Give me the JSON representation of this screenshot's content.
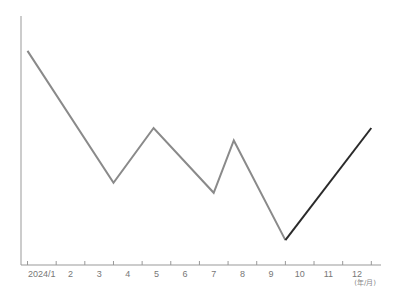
{
  "chart_data": {
    "type": "line",
    "title": "",
    "xlabel": "(年/月)",
    "ylabel": "",
    "grid": false,
    "legend": "none",
    "categories": [
      "2024/1",
      "2",
      "3",
      "4",
      "5",
      "6",
      "7",
      "8",
      "9",
      "10",
      "11",
      "12"
    ],
    "x_unit_label": "(年/月)",
    "ylim": [
      0,
      100
    ],
    "y_ticks_shown": false,
    "series": [
      {
        "name": "trend",
        "color": "#8a8a8a",
        "points": [
          {
            "x": 0.5,
            "y": 86
          },
          {
            "x": 3.5,
            "y": 33
          },
          {
            "x": 4.9,
            "y": 55
          },
          {
            "x": 7.0,
            "y": 29
          },
          {
            "x": 7.7,
            "y": 50
          },
          {
            "x": 9.5,
            "y": 10
          }
        ]
      },
      {
        "name": "highlight",
        "color": "#2a2a2a",
        "points": [
          {
            "x": 9.5,
            "y": 10
          },
          {
            "x": 12.5,
            "y": 55
          }
        ]
      }
    ]
  },
  "axes": {
    "color": "#999999"
  }
}
